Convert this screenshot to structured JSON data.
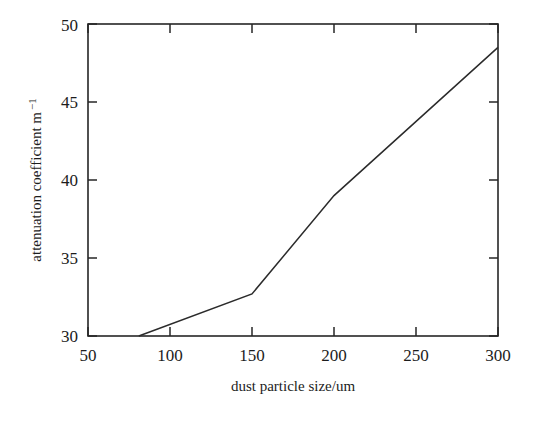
{
  "chart_data": {
    "type": "line",
    "title": "",
    "xlabel": "dust particle size/um",
    "ylabel": "attenuation coefficient m",
    "ylabel_exponent": "−1",
    "xlim": [
      50,
      300
    ],
    "ylim": [
      30,
      50
    ],
    "xticks": [
      50,
      100,
      150,
      200,
      250,
      300
    ],
    "yticks": [
      30,
      35,
      40,
      45,
      50
    ],
    "xtick_labels": [
      "50",
      "100",
      "150",
      "200",
      "250",
      "300"
    ],
    "ytick_labels": [
      "30",
      "35",
      "40",
      "45",
      "50"
    ],
    "grid": false,
    "legend": false,
    "legend_position": "none",
    "tick_direction": "in",
    "frame": "box",
    "line_color": "#2b2b2b",
    "background_color": "#ffffff",
    "series": [
      {
        "name": "attenuation coefficient",
        "x": [
          81,
          150,
          200,
          300
        ],
        "values": [
          30.0,
          32.7,
          39.0,
          48.5
        ]
      }
    ]
  },
  "axes": {
    "x_title": "dust particle size/um",
    "y_title_main": "attenuation coefficient m",
    "y_title_sup": "−1"
  }
}
